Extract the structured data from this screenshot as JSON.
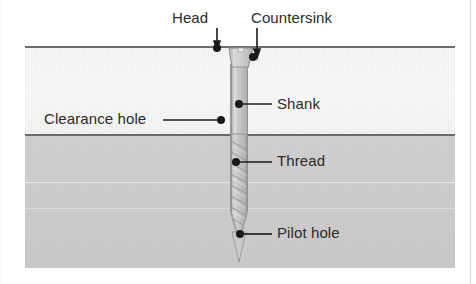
{
  "diagram": {
    "labels": {
      "head": "Head",
      "countersink": "Countersink",
      "shank": "Shank",
      "thread": "Thread",
      "pilot_hole": "Pilot hole",
      "clearance_hole": "Clearance hole"
    },
    "parts": {
      "upper_workpiece": "upper workpiece",
      "lower_workpiece": "lower workpiece",
      "screw": "screw"
    },
    "colors": {
      "upper_material": "#f5f5f3",
      "lower_material": "#cccccc",
      "screw_body": "#c4c4c4",
      "outline": "#6e6e6e",
      "label_text": "#2b2b2b",
      "leader_line": "#1a1a1a",
      "background": "#ffffff"
    }
  }
}
